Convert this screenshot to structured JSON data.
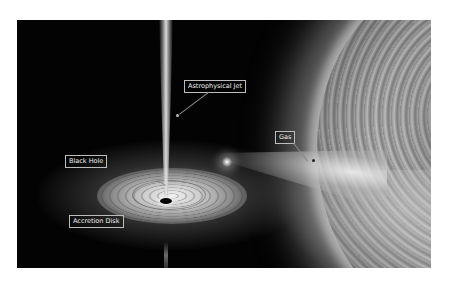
{
  "diagram": {
    "labels": {
      "jet": "Astrophysical Jet",
      "black_hole": "Black Hole",
      "accretion_disk": "Accretion Disk",
      "gas": "Gas"
    },
    "colors": {
      "background": "#030303",
      "label_border": "#bdbdbd",
      "label_text": "#f0f0f0",
      "page": "#ffffff"
    }
  }
}
